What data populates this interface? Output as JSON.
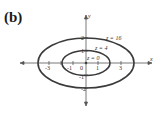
{
  "figure": {
    "panel_label": "(b)",
    "x_axis_label": "x",
    "y_axis_label": "y",
    "x_ticks": [
      "-3",
      "-1",
      "0",
      "1",
      "3"
    ],
    "y_ticks": [
      "2",
      "1",
      "-1",
      "-2"
    ],
    "contours": [
      {
        "label": "z = 16",
        "a": 4,
        "b": 2
      },
      {
        "label": "z = 4",
        "a": 2,
        "b": 1
      },
      {
        "label": "z = 0",
        "a": 0,
        "b": 0
      }
    ],
    "colors": {
      "curve": "#3a3a3a",
      "axis": "#555555"
    }
  }
}
